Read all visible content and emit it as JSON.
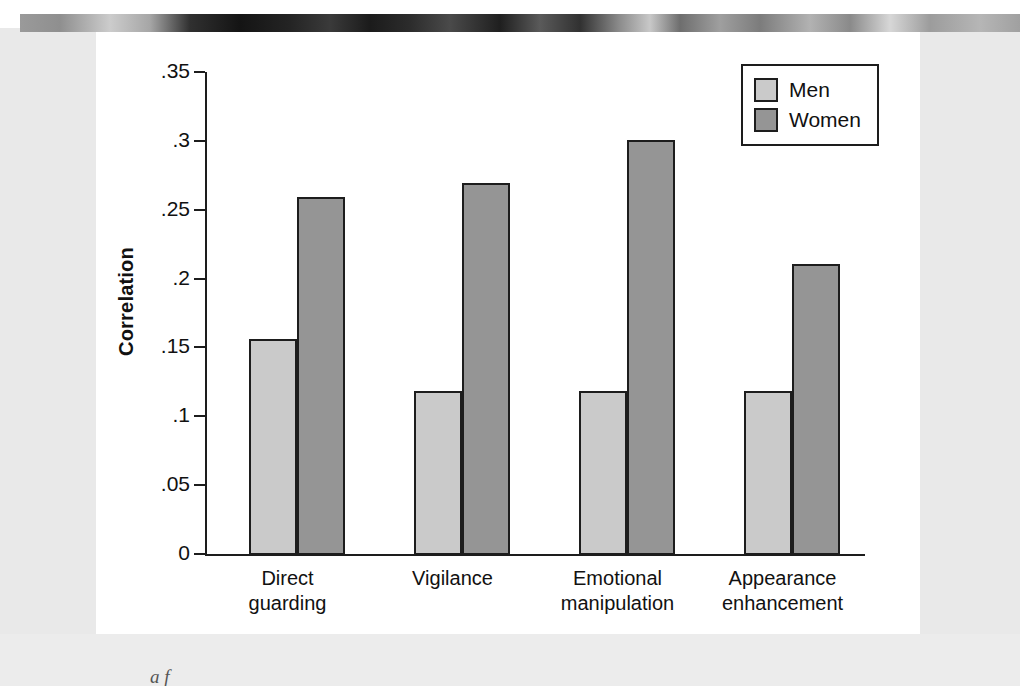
{
  "chart_data": {
    "type": "bar",
    "title": "",
    "xlabel": "",
    "ylabel": "Correlation",
    "ylim": [
      0,
      0.35
    ],
    "yticks": [
      0,
      0.05,
      0.1,
      0.15,
      0.2,
      0.25,
      0.3,
      0.35
    ],
    "ytick_labels": [
      "0",
      ".05",
      ".1",
      ".15",
      ".2",
      ".25",
      ".3",
      ".35"
    ],
    "grid": false,
    "legend_position": "top-right",
    "categories": [
      "Direct guarding",
      "Vigilance",
      "Emotional manipulation",
      "Appearance enhancement"
    ],
    "category_lines": [
      [
        "Direct",
        "guarding"
      ],
      [
        "Vigilance",
        ""
      ],
      [
        "Emotional",
        "manipulation"
      ],
      [
        "Appearance",
        "enhancement"
      ]
    ],
    "series": [
      {
        "name": "Men",
        "color": "#cacaca",
        "values": [
          0.157,
          0.119,
          0.119,
          0.119
        ]
      },
      {
        "name": "Women",
        "color": "#959595",
        "values": [
          0.26,
          0.27,
          0.301,
          0.211
        ]
      }
    ]
  },
  "legend": {
    "items": [
      {
        "label": "Men",
        "swatch": "men"
      },
      {
        "label": "Women",
        "swatch": "women"
      }
    ]
  },
  "caption": {
    "fragment": "a f"
  },
  "colors": {
    "men_bar": "#cacaca",
    "women_bar": "#959595",
    "axis": "#1d1d1d",
    "panel_background": "#ffffff",
    "page_margin": "#e9e9e9"
  }
}
